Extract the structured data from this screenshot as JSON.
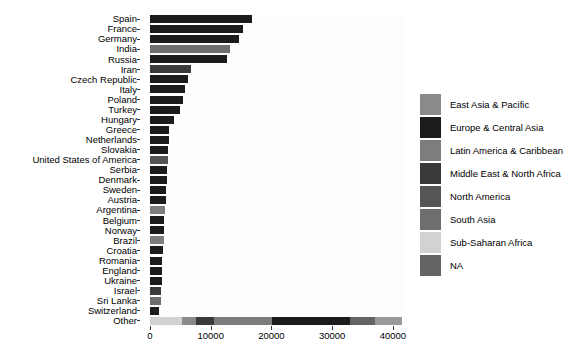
{
  "chart_data": {
    "type": "bar",
    "orientation": "horizontal",
    "stacked": true,
    "title": "",
    "xlabel": "",
    "ylabel": "",
    "xlim": [
      0,
      42000
    ],
    "xticks": [
      0,
      10000,
      20000,
      30000,
      40000
    ],
    "xtick_labels": [
      "0",
      "10000",
      "20000",
      "30000",
      "40000"
    ],
    "grid": false,
    "legend_position": "right",
    "legend": {
      "entries": [
        {
          "label": "East Asia & Pacific",
          "color": "#8a8a8a"
        },
        {
          "label": "Europe & Central Asia",
          "color": "#1c1c1c"
        },
        {
          "label": "Latin America & Caribbean",
          "color": "#7d7d7d"
        },
        {
          "label": "Middle East & North Africa",
          "color": "#3a3a3a"
        },
        {
          "label": "North America",
          "color": "#555555"
        },
        {
          "label": "South Asia",
          "color": "#6e6e6e"
        },
        {
          "label": "Sub-Saharan Africa",
          "color": "#d2d2d2"
        },
        {
          "label": "NA",
          "color": "#646464"
        }
      ]
    },
    "categories": [
      "Spain",
      "France",
      "Germany",
      "India",
      "Russia",
      "Iran",
      "Czech Republic",
      "Italy",
      "Poland",
      "Turkey",
      "Hungary",
      "Greece",
      "Netherlands",
      "Slovakia",
      "United States of America",
      "Serbia",
      "Denmark",
      "Sweden",
      "Austria",
      "Argentina",
      "Belgium",
      "Norway",
      "Brazil",
      "Croatia",
      "Romania",
      "England",
      "Ukraine",
      "Israel",
      "Sri Lanka",
      "Switzerland",
      "Other"
    ],
    "bars": [
      {
        "category": "Spain",
        "total": 16800,
        "segments": [
          {
            "region": "Europe & Central Asia",
            "value": 16800,
            "color": "#1c1c1c"
          }
        ]
      },
      {
        "category": "France",
        "total": 15300,
        "segments": [
          {
            "region": "Europe & Central Asia",
            "value": 15300,
            "color": "#1c1c1c"
          }
        ]
      },
      {
        "category": "Germany",
        "total": 14600,
        "segments": [
          {
            "region": "Europe & Central Asia",
            "value": 14600,
            "color": "#1c1c1c"
          }
        ]
      },
      {
        "category": "India",
        "total": 13200,
        "segments": [
          {
            "region": "South Asia",
            "value": 13200,
            "color": "#6e6e6e"
          }
        ]
      },
      {
        "category": "Russia",
        "total": 12600,
        "segments": [
          {
            "region": "Europe & Central Asia",
            "value": 12600,
            "color": "#1c1c1c"
          }
        ]
      },
      {
        "category": "Iran",
        "total": 6700,
        "segments": [
          {
            "region": "Middle East & North Africa",
            "value": 6700,
            "color": "#3a3a3a"
          }
        ]
      },
      {
        "category": "Czech Republic",
        "total": 6300,
        "segments": [
          {
            "region": "Europe & Central Asia",
            "value": 6300,
            "color": "#1c1c1c"
          }
        ]
      },
      {
        "category": "Italy",
        "total": 5800,
        "segments": [
          {
            "region": "Europe & Central Asia",
            "value": 5800,
            "color": "#1c1c1c"
          }
        ]
      },
      {
        "category": "Poland",
        "total": 5500,
        "segments": [
          {
            "region": "Europe & Central Asia",
            "value": 5500,
            "color": "#1c1c1c"
          }
        ]
      },
      {
        "category": "Turkey",
        "total": 5000,
        "segments": [
          {
            "region": "Europe & Central Asia",
            "value": 5000,
            "color": "#1c1c1c"
          }
        ]
      },
      {
        "category": "Hungary",
        "total": 4000,
        "segments": [
          {
            "region": "Europe & Central Asia",
            "value": 4000,
            "color": "#1c1c1c"
          }
        ]
      },
      {
        "category": "Greece",
        "total": 3200,
        "segments": [
          {
            "region": "Europe & Central Asia",
            "value": 3200,
            "color": "#1c1c1c"
          }
        ]
      },
      {
        "category": "Netherlands",
        "total": 3100,
        "segments": [
          {
            "region": "Europe & Central Asia",
            "value": 3100,
            "color": "#1c1c1c"
          }
        ]
      },
      {
        "category": "Slovakia",
        "total": 3000,
        "segments": [
          {
            "region": "Europe & Central Asia",
            "value": 3000,
            "color": "#1c1c1c"
          }
        ]
      },
      {
        "category": "United States of America",
        "total": 2950,
        "segments": [
          {
            "region": "North America",
            "value": 2950,
            "color": "#555555"
          }
        ]
      },
      {
        "category": "Serbia",
        "total": 2800,
        "segments": [
          {
            "region": "Europe & Central Asia",
            "value": 2800,
            "color": "#1c1c1c"
          }
        ]
      },
      {
        "category": "Denmark",
        "total": 2750,
        "segments": [
          {
            "region": "Europe & Central Asia",
            "value": 2750,
            "color": "#1c1c1c"
          }
        ]
      },
      {
        "category": "Sweden",
        "total": 2700,
        "segments": [
          {
            "region": "Europe & Central Asia",
            "value": 2700,
            "color": "#1c1c1c"
          }
        ]
      },
      {
        "category": "Austria",
        "total": 2600,
        "segments": [
          {
            "region": "Europe & Central Asia",
            "value": 2600,
            "color": "#1c1c1c"
          }
        ]
      },
      {
        "category": "Argentina",
        "total": 2500,
        "segments": [
          {
            "region": "Latin America & Caribbean",
            "value": 2500,
            "color": "#7d7d7d"
          }
        ]
      },
      {
        "category": "Belgium",
        "total": 2350,
        "segments": [
          {
            "region": "Europe & Central Asia",
            "value": 2350,
            "color": "#1c1c1c"
          }
        ]
      },
      {
        "category": "Norway",
        "total": 2300,
        "segments": [
          {
            "region": "Europe & Central Asia",
            "value": 2300,
            "color": "#1c1c1c"
          }
        ]
      },
      {
        "category": "Brazil",
        "total": 2250,
        "segments": [
          {
            "region": "Latin America & Caribbean",
            "value": 2250,
            "color": "#7d7d7d"
          }
        ]
      },
      {
        "category": "Croatia",
        "total": 2100,
        "segments": [
          {
            "region": "Europe & Central Asia",
            "value": 2100,
            "color": "#1c1c1c"
          }
        ]
      },
      {
        "category": "Romania",
        "total": 2050,
        "segments": [
          {
            "region": "Europe & Central Asia",
            "value": 2050,
            "color": "#1c1c1c"
          }
        ]
      },
      {
        "category": "England",
        "total": 1950,
        "segments": [
          {
            "region": "Europe & Central Asia",
            "value": 1950,
            "color": "#1c1c1c"
          }
        ]
      },
      {
        "category": "Ukraine",
        "total": 1900,
        "segments": [
          {
            "region": "Europe & Central Asia",
            "value": 1900,
            "color": "#1c1c1c"
          }
        ]
      },
      {
        "category": "Israel",
        "total": 1800,
        "segments": [
          {
            "region": "Middle East & North Africa",
            "value": 1800,
            "color": "#3a3a3a"
          }
        ]
      },
      {
        "category": "Sri Lanka",
        "total": 1750,
        "segments": [
          {
            "region": "South Asia",
            "value": 1750,
            "color": "#6e6e6e"
          }
        ]
      },
      {
        "category": "Switzerland",
        "total": 1550,
        "segments": [
          {
            "region": "Europe & Central Asia",
            "value": 1550,
            "color": "#1c1c1c"
          }
        ]
      },
      {
        "category": "Other",
        "total": 41500,
        "segments": [
          {
            "region": "Sub-Saharan Africa",
            "value": 5200,
            "color": "#d2d2d2"
          },
          {
            "region": "East Asia & Pacific",
            "value": 2400,
            "color": "#8a8a8a"
          },
          {
            "region": "Middle East & North Africa",
            "value": 3000,
            "color": "#3a3a3a"
          },
          {
            "region": "Latin America & Caribbean",
            "value": 9500,
            "color": "#7d7d7d"
          },
          {
            "region": "Europe & Central Asia",
            "value": 12800,
            "color": "#1c1c1c"
          },
          {
            "region": "NA",
            "value": 4200,
            "color": "#646464"
          },
          {
            "region": "South Asia",
            "value": 4400,
            "color": "#9a9a9a"
          }
        ]
      }
    ]
  }
}
